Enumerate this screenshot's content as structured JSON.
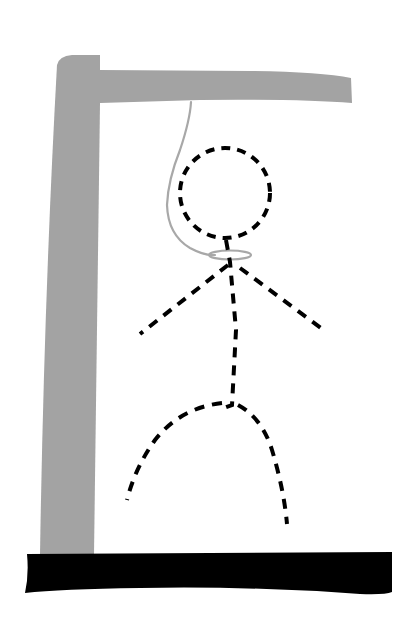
{
  "illustration": {
    "title": "Hangman drawing",
    "parts": [
      "gallows-post",
      "gallows-beam",
      "gallows-base",
      "rope",
      "noose",
      "head",
      "neck-body",
      "left-arm",
      "right-arm",
      "left-leg",
      "right-leg"
    ],
    "colors": {
      "background": "#ffffff",
      "gallows_wood": "#a3a3a3",
      "base": "#000000",
      "rope": "#a8a8a8",
      "figure": "#000000"
    },
    "figure_style": "dashed"
  }
}
